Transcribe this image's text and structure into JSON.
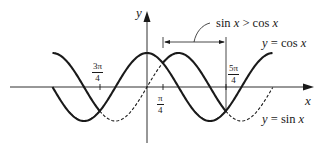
{
  "diagram": {
    "type": "function-graph",
    "axes": {
      "x_label": "x",
      "y_label": "y"
    },
    "curves": [
      {
        "name": "cos",
        "label": "y = cos x",
        "style": "solid"
      },
      {
        "name": "sin",
        "label": "y = sin x",
        "style": "solid where sin x > cos x, dashed otherwise"
      }
    ],
    "ticks": [
      {
        "id": "neg-3pi-4",
        "num": "3π",
        "den": "4"
      },
      {
        "id": "pi-4",
        "num": "π",
        "den": "4"
      },
      {
        "id": "5pi-4",
        "num": "5π",
        "den": "4"
      }
    ],
    "interval_annotation": {
      "label": "sin x > cos x",
      "from": "π/4",
      "to": "5π/4"
    },
    "colors": {
      "ink": "#1a1a1a",
      "background": "#ffffff"
    }
  }
}
